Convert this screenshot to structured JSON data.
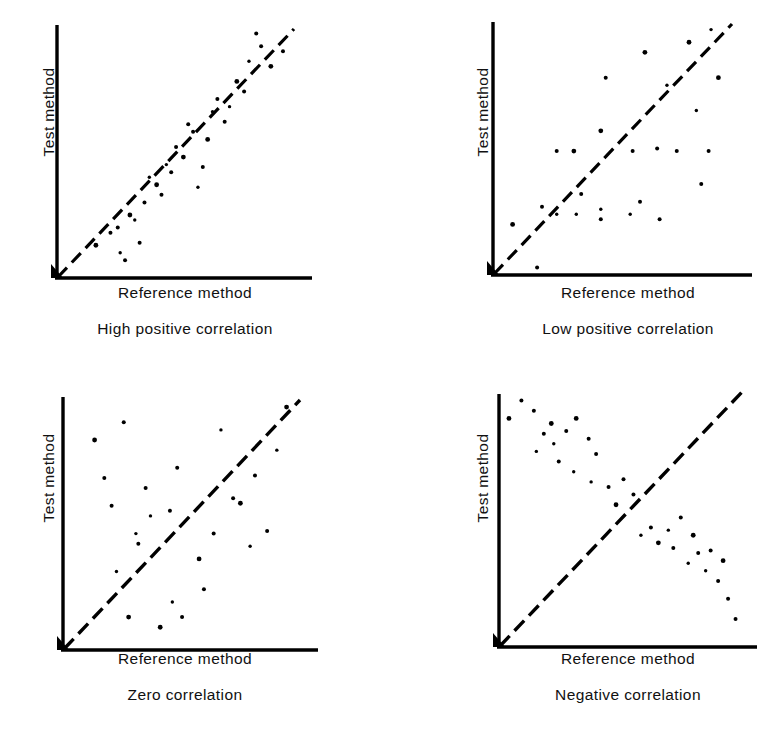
{
  "figure": {
    "axis_color": "#000000",
    "point_color": "#000000",
    "identity_line_color": "#000000",
    "background": "#ffffff"
  },
  "panels": [
    {
      "id": "high-positive",
      "ylabel": "Test method",
      "xlabel": "Reference method",
      "caption": "High positive correlation"
    },
    {
      "id": "low-positive",
      "ylabel": "Test method",
      "xlabel": "Reference method",
      "caption": "Low positive correlation"
    },
    {
      "id": "zero",
      "ylabel": "Test method",
      "xlabel": "Reference method",
      "caption": "Zero correlation"
    },
    {
      "id": "negative",
      "ylabel": "Test method",
      "xlabel": "Reference method",
      "caption": "Negative correlation"
    }
  ],
  "chart_data": [
    {
      "type": "scatter",
      "title": "High positive correlation",
      "xlabel": "Reference method",
      "ylabel": "Test method",
      "xlim": [
        0,
        100
      ],
      "ylim": [
        0,
        100
      ],
      "grid": false,
      "legend": "none",
      "annotations": [
        "dashed identity line y = x"
      ],
      "reference_line": {
        "style": "dashed",
        "from": [
          0,
          0
        ],
        "to": [
          96,
          96
        ]
      },
      "points": [
        [
          16,
          13
        ],
        [
          22,
          18
        ],
        [
          25,
          20
        ],
        [
          26,
          10
        ],
        [
          28,
          7
        ],
        [
          30,
          25
        ],
        [
          32,
          23
        ],
        [
          34,
          14
        ],
        [
          36,
          30
        ],
        [
          38,
          40
        ],
        [
          41,
          37
        ],
        [
          43,
          33
        ],
        [
          45,
          45
        ],
        [
          47,
          42
        ],
        [
          49,
          52
        ],
        [
          52,
          48
        ],
        [
          54,
          61
        ],
        [
          56,
          58
        ],
        [
          58,
          36
        ],
        [
          60,
          44
        ],
        [
          62,
          55
        ],
        [
          64,
          66
        ],
        [
          66,
          71
        ],
        [
          69,
          62
        ],
        [
          71,
          68
        ],
        [
          74,
          78
        ],
        [
          77,
          74
        ],
        [
          79,
          86
        ],
        [
          82,
          97
        ],
        [
          84,
          92
        ],
        [
          88,
          84
        ],
        [
          93,
          90
        ]
      ]
    },
    {
      "type": "scatter",
      "title": "Low positive correlation",
      "xlabel": "Reference method",
      "ylabel": "Test method",
      "xlim": [
        0,
        100
      ],
      "ylim": [
        0,
        100
      ],
      "grid": false,
      "legend": "none",
      "annotations": [
        "dashed identity line y = x"
      ],
      "reference_line": {
        "style": "dashed",
        "from": [
          0,
          0
        ],
        "to": [
          96,
          96
        ]
      },
      "points": [
        [
          8,
          20
        ],
        [
          18,
          3
        ],
        [
          20,
          27
        ],
        [
          26,
          24
        ],
        [
          26,
          49
        ],
        [
          33,
          49
        ],
        [
          34,
          24
        ],
        [
          36,
          32
        ],
        [
          44,
          22
        ],
        [
          44,
          26
        ],
        [
          44,
          57
        ],
        [
          46,
          78
        ],
        [
          56,
          24
        ],
        [
          57,
          49
        ],
        [
          60,
          29
        ],
        [
          62,
          88
        ],
        [
          67,
          50
        ],
        [
          68,
          22
        ],
        [
          71,
          75
        ],
        [
          75,
          49
        ],
        [
          80,
          92
        ],
        [
          83,
          65
        ],
        [
          85,
          36
        ],
        [
          88,
          49
        ],
        [
          89,
          97
        ],
        [
          92,
          78
        ]
      ]
    },
    {
      "type": "scatter",
      "title": "Zero correlation",
      "xlabel": "Reference method",
      "ylabel": "Test method",
      "xlim": [
        0,
        100
      ],
      "ylim": [
        0,
        100
      ],
      "grid": false,
      "legend": "none",
      "annotations": [
        "dashed identity line y = x"
      ],
      "reference_line": {
        "style": "dashed",
        "from": [
          0,
          0
        ],
        "to": [
          96,
          96
        ]
      },
      "points": [
        [
          13,
          83
        ],
        [
          17,
          68
        ],
        [
          20,
          57
        ],
        [
          22,
          31
        ],
        [
          25,
          90
        ],
        [
          27,
          13
        ],
        [
          30,
          46
        ],
        [
          31,
          42
        ],
        [
          34,
          64
        ],
        [
          36,
          53
        ],
        [
          40,
          9
        ],
        [
          44,
          55
        ],
        [
          45,
          19
        ],
        [
          47,
          72
        ],
        [
          49,
          13
        ],
        [
          56,
          36
        ],
        [
          58,
          24
        ],
        [
          62,
          46
        ],
        [
          65,
          87
        ],
        [
          70,
          60
        ],
        [
          73,
          58
        ],
        [
          77,
          41
        ],
        [
          79,
          69
        ],
        [
          84,
          47
        ],
        [
          88,
          79
        ],
        [
          92,
          96
        ]
      ]
    },
    {
      "type": "scatter",
      "title": "Negative correlation",
      "xlabel": "Reference method",
      "ylabel": "Test method",
      "xlim": [
        0,
        100
      ],
      "ylim": [
        0,
        100
      ],
      "grid": false,
      "legend": "none",
      "annotations": [
        "dashed identity line y = x"
      ],
      "reference_line": {
        "style": "dashed",
        "from": [
          0,
          0
        ],
        "to": [
          96,
          96
        ]
      },
      "points": [
        [
          4,
          90
        ],
        [
          9,
          97
        ],
        [
          14,
          93
        ],
        [
          15,
          77
        ],
        [
          18,
          84
        ],
        [
          21,
          88
        ],
        [
          22,
          80
        ],
        [
          24,
          73
        ],
        [
          27,
          85
        ],
        [
          30,
          69
        ],
        [
          31,
          90
        ],
        [
          36,
          82
        ],
        [
          37,
          65
        ],
        [
          39,
          76
        ],
        [
          44,
          63
        ],
        [
          47,
          56
        ],
        [
          50,
          66
        ],
        [
          54,
          60
        ],
        [
          57,
          44
        ],
        [
          61,
          47
        ],
        [
          64,
          41
        ],
        [
          68,
          46
        ],
        [
          70,
          39
        ],
        [
          73,
          51
        ],
        [
          76,
          33
        ],
        [
          78,
          44
        ],
        [
          80,
          37
        ],
        [
          83,
          30
        ],
        [
          85,
          38
        ],
        [
          88,
          26
        ],
        [
          90,
          34
        ],
        [
          92,
          19
        ],
        [
          95,
          11
        ]
      ]
    }
  ]
}
